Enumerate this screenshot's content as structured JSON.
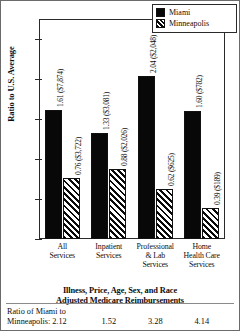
{
  "chart_data": {
    "type": "bar",
    "title": "",
    "caption": "Illness, Price, Age, Sex, and Race Adjusted Medicare Reimbursements",
    "caption_line1": "Illness, Price, Age, Sex, and Race",
    "caption_line2": "Adjusted Medicare Reimbursements",
    "xlabel": "",
    "ylabel": "Ratio to U.S. Average",
    "ylim": [
      0.0,
      2.75
    ],
    "yticks": [
      "0.0",
      "0.5",
      "1.0",
      "1.5",
      "2.0",
      "2.5"
    ],
    "ytick_values": [
      0.0,
      0.5,
      1.0,
      1.5,
      2.0,
      2.5
    ],
    "grid": false,
    "legend_position": "top-right",
    "categories": [
      "All Services",
      "Inpatient Services",
      "Professional & Lab Services",
      "Home Health Care Services"
    ],
    "category_lines": [
      [
        "All",
        "Services"
      ],
      [
        "Inpatient",
        "Services"
      ],
      [
        "Professional",
        "& Lab",
        "Services"
      ],
      [
        "Home",
        "Health Care",
        "Services"
      ]
    ],
    "series": [
      {
        "name": "Miami",
        "color": "#080808",
        "fill": "solid",
        "values": [
          1.61,
          1.33,
          2.04,
          1.6
        ],
        "dollars": [
          "$7,874",
          "$3,081",
          "$2,048",
          "$782"
        ],
        "labels": [
          "1.61 ($7,874)",
          "1.33 ($3,081)",
          "2.04 ($2,048)",
          "1.60 ($782)"
        ]
      },
      {
        "name": "Minneapolis",
        "color": "#ffffff",
        "fill": "diagonal-hatch",
        "values": [
          0.76,
          0.88,
          0.62,
          0.39
        ],
        "dollars": [
          "$3,722",
          "$2,026",
          "$625",
          "$189"
        ],
        "labels": [
          "0.76 ($3,722)",
          "0.88 ($2,026)",
          "0.62 ($625)",
          "0.39 ($189)"
        ]
      }
    ],
    "ratio_label_line1": "Ratio of Miami to",
    "ratio_label_line2": "Minneapolis: 2.12",
    "ratios": [
      "2.12",
      "1.52",
      "3.28",
      "4.14"
    ]
  },
  "legend": {
    "items": [
      {
        "label": "Miami"
      },
      {
        "label": "Minneapolis"
      }
    ]
  }
}
